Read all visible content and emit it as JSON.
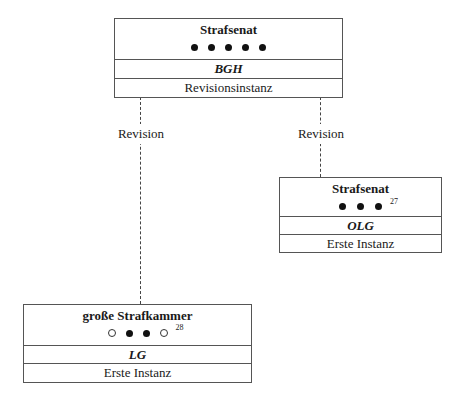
{
  "diagram": {
    "boxes": {
      "bgh": {
        "title": "Strafsenat",
        "dots": [
          "filled",
          "filled",
          "filled",
          "filled",
          "filled"
        ],
        "footnote": "",
        "court": "BGH",
        "instance": "Revisionsinstanz"
      },
      "olg": {
        "title": "Strafsenat",
        "dots": [
          "filled",
          "filled",
          "filled"
        ],
        "footnote": "27",
        "court": "OLG",
        "instance": "Erste Instanz"
      },
      "lg": {
        "title": "große Strafkammer",
        "dots": [
          "empty",
          "filled",
          "filled",
          "empty"
        ],
        "footnote": "28",
        "court": "LG",
        "instance": "Erste Instanz"
      }
    },
    "edges": [
      {
        "from": "lg",
        "to": "bgh",
        "label": "Revision",
        "style": "dashed"
      },
      {
        "from": "olg",
        "to": "bgh",
        "label": "Revision",
        "style": "dashed"
      }
    ]
  }
}
